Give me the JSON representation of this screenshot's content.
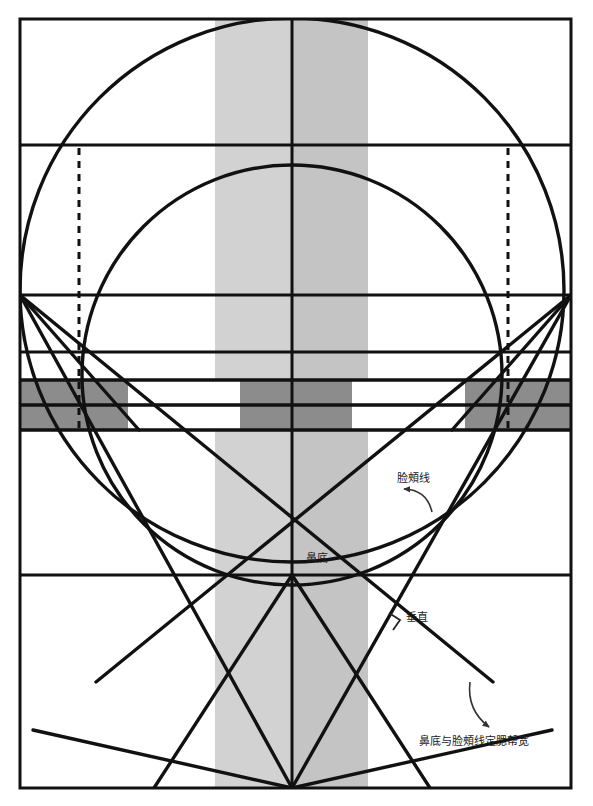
{
  "diagram": {
    "canvas": {
      "width": 593,
      "height": 806,
      "background": "#ffffff"
    },
    "frame": {
      "x": 20,
      "y": 19,
      "width": 551,
      "height": 769,
      "stroke": "#111111",
      "stroke_width": 3
    },
    "colors": {
      "line": "#111111",
      "light_band": "#d2d2d2",
      "mid_band": "#c0c0c0",
      "dark_band": "#8c8c8c",
      "pale_band": "#e8e8e8",
      "white": "#ffffff",
      "label_text": "#1a1a1a"
    },
    "labels": [
      {
        "id": "cheek-line",
        "text": "脸頰线",
        "x": 397,
        "y": 482,
        "anchor": "start",
        "arrow": {
          "from": [
            432,
            512
          ],
          "to": [
            404,
            489
          ],
          "curve": "arc"
        }
      },
      {
        "id": "nose-base",
        "text": "鼻底",
        "x": 306,
        "y": 562,
        "anchor": "start",
        "arrow": null
      },
      {
        "id": "perpendicular",
        "text": "垂直",
        "x": 406,
        "y": 621,
        "anchor": "start",
        "arrow": null,
        "marker": "right-angle"
      },
      {
        "id": "jaw-width-rule",
        "text": "鼻底与脸頰线定腮帮宽",
        "x": 419,
        "y": 745,
        "anchor": "start",
        "arrow": {
          "from": [
            470,
            682
          ],
          "to": [
            489,
            727
          ],
          "curve": "arc"
        }
      }
    ],
    "horizontal_rules": [
      {
        "id": "hairline",
        "y": 145,
        "x1": 20,
        "x2": 571
      },
      {
        "id": "brow-line",
        "y": 295,
        "x1": 20,
        "x2": 571
      },
      {
        "id": "upper-eye-line",
        "y": 352,
        "x1": 20,
        "x2": 571
      },
      {
        "id": "eye-band-top",
        "y": 380,
        "x1": 20,
        "x2": 571
      },
      {
        "id": "eye-band-mid",
        "y": 405,
        "x1": 20,
        "x2": 571
      },
      {
        "id": "eye-band-bottom",
        "y": 430,
        "x1": 20,
        "x2": 571
      },
      {
        "id": "nose-base-line",
        "y": 575,
        "x1": 20,
        "x2": 571
      }
    ],
    "vertical_rules": [
      {
        "id": "center-axis",
        "x": 292,
        "y1": 19,
        "y2": 788
      }
    ],
    "vertical_bands": [
      {
        "id": "center-left-band",
        "x": 215,
        "width": 77,
        "y": 19,
        "height": 769,
        "fill": "#d2d2d2"
      },
      {
        "id": "center-right-band",
        "x": 292,
        "width": 76,
        "y": 19,
        "height": 769,
        "fill": "#c4c4c4"
      }
    ],
    "eye_band": {
      "y_top": 380,
      "y_mid": 405,
      "y_bottom": 430,
      "segments": [
        {
          "id": "seg-1",
          "x": 20,
          "width": 108,
          "fill": "#8c8c8c"
        },
        {
          "id": "seg-2",
          "x": 128,
          "width": 112,
          "fill": "#ffffff"
        },
        {
          "id": "seg-3",
          "x": 240,
          "width": 112,
          "fill": "#8c8c8c"
        },
        {
          "id": "seg-4",
          "x": 352,
          "width": 113,
          "fill": "#ffffff"
        },
        {
          "id": "seg-5",
          "x": 465,
          "width": 106,
          "fill": "#8c8c8c"
        }
      ]
    },
    "circles": [
      {
        "id": "cranium-circle",
        "cx": 292,
        "cy": 290,
        "r": 272,
        "clip": "frame"
      },
      {
        "id": "face-circle",
        "cx": 292,
        "cy": 375,
        "r": 210,
        "clip": "frame"
      }
    ],
    "dashed_lines": [
      {
        "id": "left-dashed",
        "x": 79,
        "y1": 148,
        "y2": 430
      },
      {
        "id": "right-dashed",
        "x": 508,
        "y1": 148,
        "y2": 430
      }
    ],
    "construction_lines": [
      {
        "id": "left-cheek-to-chin",
        "x1": 20,
        "y1": 295,
        "x2": 292,
        "y2": 788
      },
      {
        "id": "right-cheek-to-chin",
        "x1": 571,
        "y1": 295,
        "x2": 292,
        "y2": 788
      },
      {
        "id": "left-jaw-diag",
        "x1": 20,
        "y1": 295,
        "x2": 493,
        "y2": 682
      },
      {
        "id": "right-jaw-diag",
        "x1": 571,
        "y1": 295,
        "x2": 96,
        "y2": 682
      },
      {
        "id": "left-chin-spread",
        "x1": 292,
        "y1": 788,
        "x2": 33,
        "y2": 730
      },
      {
        "id": "right-chin-spread",
        "x1": 292,
        "y1": 788,
        "x2": 552,
        "y2": 730
      },
      {
        "id": "left-nose-wing",
        "x1": 292,
        "y1": 575,
        "x2": 154,
        "y2": 788
      },
      {
        "id": "right-nose-wing",
        "x1": 292,
        "y1": 575,
        "x2": 430,
        "y2": 788
      },
      {
        "id": "left-temple-diag",
        "x1": 20,
        "y1": 295,
        "x2": 139,
        "y2": 430
      },
      {
        "id": "right-temple-diag",
        "x1": 571,
        "y1": 295,
        "x2": 452,
        "y2": 430
      }
    ],
    "legend_note": ""
  }
}
